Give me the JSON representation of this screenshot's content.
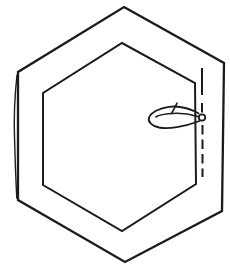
{
  "drawing": {
    "background": "#ffffff",
    "stroke_color": "#1b1b1b",
    "width": 230,
    "height": 273,
    "shapes": [
      {
        "name": "outer-hexagon",
        "type": "polygon",
        "points": "124,7 224,63 222,211 125,262 18,200 18,72",
        "stroke_width": 2.3,
        "fill": "none",
        "linejoin": "miter"
      },
      {
        "name": "inner-hexagon",
        "type": "polygon",
        "points": "122,43 195,83 196,184 122,231 43,185 43,93",
        "stroke_width": 2,
        "fill": "none",
        "linejoin": "miter"
      },
      {
        "name": "sketch-overdraw-line",
        "type": "path",
        "d": "M 17,75 C 14.2,100 13.8,120 14.6,140 C 15.2,162 15.9,182 16.8,198",
        "stroke_width": 1.4,
        "fill": "none",
        "linecap": "round"
      },
      {
        "name": "thread-tail-line",
        "type": "line",
        "x1": 202,
        "y1": 68,
        "x2": 202,
        "y2": 95,
        "stroke_width": 2
      },
      {
        "name": "basting-dash-upper",
        "type": "line",
        "x1": 202,
        "y1": 103,
        "x2": 202,
        "y2": 112.5,
        "stroke_width": 2
      },
      {
        "name": "basting-dashes-lower",
        "type": "line",
        "x1": 202.5,
        "y1": 125,
        "x2": 202.5,
        "y2": 177,
        "stroke_width": 2,
        "dasharray": "9.5,5"
      },
      {
        "name": "thread-loop-outer",
        "type": "path",
        "d": "M 198.5,113.2 C 189,108 178,105.8 169,106.8 C 159,108 151,112.5 149,117.5 C 147.5,122 152,126 159,127.5 C 169,129.3 185,126.5 195,122.5 L 199.5,121",
        "stroke_width": 1.8,
        "fill": "none",
        "linecap": "round"
      },
      {
        "name": "thread-loop-inner",
        "type": "path",
        "d": "M 198,116.5 C 188,113.5 176,112.8 168,113.8 C 163,114.4 158,115.5 156,117",
        "stroke_width": 1.6,
        "fill": "none",
        "linecap": "round"
      },
      {
        "name": "thread-loop-tail",
        "type": "path",
        "d": "M 171.5,113.5 C 173.5,110 175.5,106.5 177,103.2",
        "stroke_width": 1.6,
        "fill": "none",
        "linecap": "round"
      },
      {
        "name": "knot-circle",
        "type": "circle",
        "cx": 202,
        "cy": 117.5,
        "r": 3.2,
        "stroke_width": 1.8,
        "fill": "#ffffff"
      }
    ]
  }
}
